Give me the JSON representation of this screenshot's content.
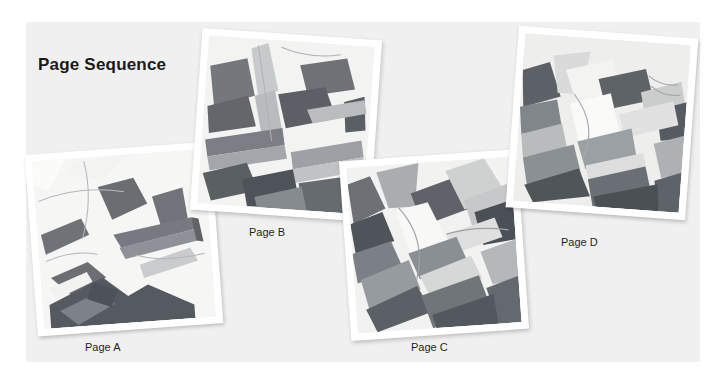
{
  "slide": {
    "title": "Page Sequence",
    "background_color": "#ffffff",
    "panel_color": "#f0f0f0",
    "title_color": "#1a1a1a"
  },
  "photos": [
    {
      "id": "a",
      "caption": "Page A",
      "alt": "grayscale abstract angular drawing of folded paper forms",
      "rotation_deg": -4.2,
      "frame_color": "#ffffff"
    },
    {
      "id": "b",
      "caption": "Page B",
      "alt": "grayscale abstract angular drawing of folded paper forms",
      "rotation_deg": 4.0,
      "frame_color": "#ffffff"
    },
    {
      "id": "c",
      "caption": "Page C",
      "alt": "grayscale abstract angular close-up of stacked paper edges",
      "rotation_deg": -4.0,
      "frame_color": "#ffffff"
    },
    {
      "id": "d",
      "caption": "Page D",
      "alt": "grayscale abstract angular close-up of stacked paper edges",
      "rotation_deg": 4.2,
      "frame_color": "#ffffff"
    }
  ]
}
